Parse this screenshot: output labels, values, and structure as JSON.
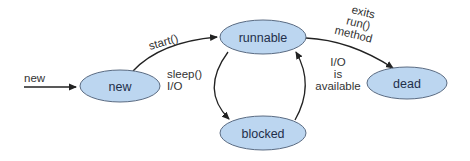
{
  "diagram": {
    "type": "state-diagram",
    "colors": {
      "node_fill": "#bcd6f0",
      "node_stroke": "#5a6b82",
      "edge": "#222222",
      "text": "#333333"
    },
    "nodes": [
      {
        "id": "new",
        "label": "new"
      },
      {
        "id": "runnable",
        "label": "runnable"
      },
      {
        "id": "blocked",
        "label": "blocked"
      },
      {
        "id": "dead",
        "label": "dead"
      }
    ],
    "edges": [
      {
        "from": "(start)",
        "to": "new",
        "label": "new"
      },
      {
        "from": "new",
        "to": "runnable",
        "label": "start()"
      },
      {
        "from": "runnable",
        "to": "blocked",
        "label_lines": [
          "sleep()",
          "I/O"
        ]
      },
      {
        "from": "blocked",
        "to": "runnable",
        "label_lines": [
          "I/O",
          "is",
          "available"
        ]
      },
      {
        "from": "runnable",
        "to": "dead",
        "label_lines": [
          "exits",
          "run()",
          "method"
        ]
      }
    ]
  }
}
